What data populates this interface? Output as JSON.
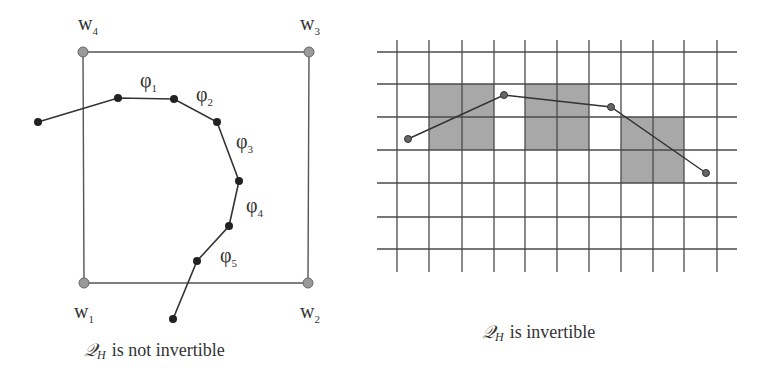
{
  "left_panel": {
    "caption": {
      "symbol": "𝒬",
      "subscript": "H",
      "text": "is not invertible"
    },
    "corners": [
      {
        "name": "w",
        "sub": "4",
        "x": 83,
        "y": 52,
        "lx": 78,
        "ly": 30
      },
      {
        "name": "w",
        "sub": "3",
        "x": 309,
        "y": 52,
        "lx": 300,
        "ly": 30
      },
      {
        "name": "w",
        "sub": "1",
        "x": 84,
        "y": 283,
        "lx": 74,
        "ly": 318
      },
      {
        "name": "w",
        "sub": "2",
        "x": 308,
        "y": 283,
        "lx": 300,
        "ly": 318
      }
    ],
    "polyline": [
      [
        38,
        122
      ],
      [
        118,
        98
      ],
      [
        174,
        99
      ],
      [
        217,
        122
      ],
      [
        239,
        181
      ],
      [
        229,
        226
      ],
      [
        197,
        261
      ],
      [
        173,
        319
      ]
    ],
    "segment_labels": [
      {
        "name": "φ",
        "sub": "1",
        "x": 140,
        "y": 87
      },
      {
        "name": "φ",
        "sub": "2",
        "x": 196,
        "y": 101
      },
      {
        "name": "φ",
        "sub": "3",
        "x": 236,
        "y": 148
      },
      {
        "name": "φ",
        "sub": "4",
        "x": 246,
        "y": 212
      },
      {
        "name": "φ",
        "sub": "5",
        "x": 220,
        "y": 262
      }
    ],
    "colors": {
      "corner_fill": "#9a9a9a",
      "node_fill": "#222222",
      "line": "#333333"
    }
  },
  "right_panel": {
    "caption": {
      "symbol": "𝒬",
      "subscript": "H",
      "text": "is invertible"
    },
    "grid": {
      "xs": [
        397,
        429,
        462,
        494,
        525,
        557,
        589,
        621,
        653,
        684,
        717
      ],
      "ys": [
        52,
        84,
        117,
        150,
        183,
        217,
        249
      ],
      "x_extent": [
        377,
        737
      ],
      "y_extent": [
        40,
        272
      ]
    },
    "shaded_cells": [
      {
        "x0": 429,
        "y0": 84,
        "x1": 494,
        "y1": 150
      },
      {
        "x0": 525,
        "y0": 84,
        "x1": 589,
        "y1": 150
      },
      {
        "x0": 621,
        "y0": 117,
        "x1": 684,
        "y1": 183
      }
    ],
    "polyline": [
      [
        408,
        139
      ],
      [
        504,
        95
      ],
      [
        611,
        107
      ],
      [
        706,
        173
      ]
    ],
    "colors": {
      "shade": "#a8a8a8",
      "grid": "#4a4a4a",
      "node_fill": "#666666"
    }
  }
}
